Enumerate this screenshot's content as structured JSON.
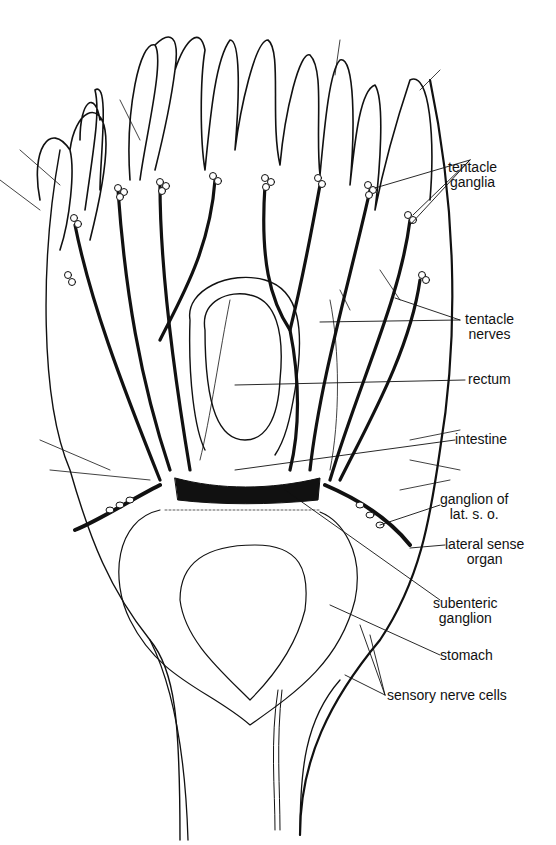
{
  "figure": {
    "ink_color": "#111111",
    "background": "#ffffff"
  },
  "labels": {
    "tentacle_ganglia": {
      "line1": "tentacle",
      "line2": "ganglia"
    },
    "tentacle_nerves": {
      "line1": "tentacle",
      "line2": "nerves"
    },
    "rectum": "rectum",
    "intestine": "intestine",
    "ganglion_lat_so": {
      "line1": "ganglion of",
      "line2": "lat. s. o."
    },
    "lateral_sense_organ": {
      "line1": "lateral sense",
      "line2": "organ"
    },
    "subenteric_ganglion": {
      "line1": "subenteric",
      "line2": "ganglion"
    },
    "stomach": "stomach",
    "sensory_nerve_cells": "sensory nerve cells"
  }
}
